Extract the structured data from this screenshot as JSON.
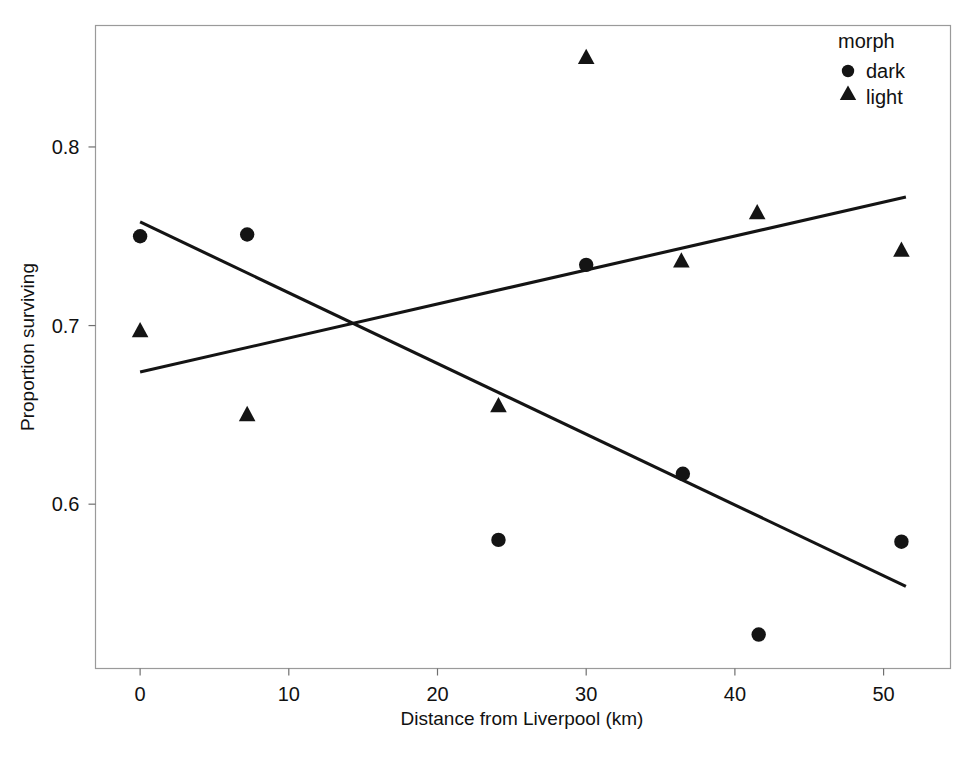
{
  "chart_data": {
    "type": "scatter",
    "title": "",
    "xlabel": "Distance from Liverpool (km)",
    "ylabel": "Proportion surviving",
    "xlim": [
      -3.0,
      54.5
    ],
    "ylim": [
      0.508,
      0.868
    ],
    "xticks": [
      0,
      10,
      20,
      30,
      40,
      50
    ],
    "xticklabels": [
      "0",
      "10",
      "20",
      "30",
      "40",
      "50"
    ],
    "yticks": [
      0.6,
      0.7,
      0.8
    ],
    "yticklabels": [
      "0.6",
      "0.7",
      "0.8"
    ],
    "grid": false,
    "legend": {
      "title": "morph",
      "position": "top-right",
      "entries": [
        {
          "label": "dark",
          "marker": "circle"
        },
        {
          "label": "light",
          "marker": "triangle"
        }
      ]
    },
    "series": [
      {
        "name": "dark",
        "marker": "circle",
        "color": "#141414",
        "points": [
          {
            "x": 0.0,
            "y": 0.75
          },
          {
            "x": 7.2,
            "y": 0.751
          },
          {
            "x": 24.1,
            "y": 0.58
          },
          {
            "x": 30.0,
            "y": 0.734
          },
          {
            "x": 36.5,
            "y": 0.617
          },
          {
            "x": 41.6,
            "y": 0.527
          },
          {
            "x": 51.2,
            "y": 0.579
          }
        ],
        "trendline": {
          "x0": 0.0,
          "y0": 0.758,
          "x1": 51.5,
          "y1": 0.554
        }
      },
      {
        "name": "light",
        "marker": "triangle",
        "color": "#141414",
        "points": [
          {
            "x": 0.0,
            "y": 0.697
          },
          {
            "x": 7.2,
            "y": 0.65
          },
          {
            "x": 24.1,
            "y": 0.655
          },
          {
            "x": 30.0,
            "y": 0.85
          },
          {
            "x": 36.4,
            "y": 0.736
          },
          {
            "x": 41.5,
            "y": 0.763
          },
          {
            "x": 51.2,
            "y": 0.742
          }
        ],
        "trendline": {
          "x0": 0.0,
          "y0": 0.674,
          "x1": 51.5,
          "y1": 0.772
        }
      }
    ]
  },
  "axes": {
    "x_label": "Distance from Liverpool (km)",
    "y_label": "Proportion surviving",
    "x_tick_labels": [
      "0",
      "10",
      "20",
      "30",
      "40",
      "50"
    ],
    "y_tick_labels": [
      "0.6",
      "0.7",
      "0.8"
    ]
  },
  "legend": {
    "title": "morph",
    "dark_label": "dark",
    "light_label": "light"
  },
  "colors": {
    "marker": "#141414",
    "line": "#141414",
    "frame": "#9a9a9a",
    "background": "#ffffff"
  }
}
